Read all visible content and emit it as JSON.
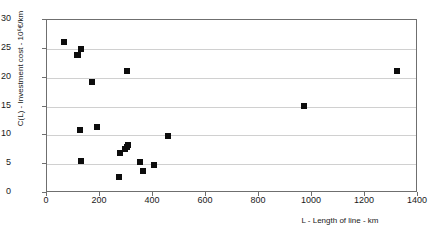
{
  "chart_data": {
    "type": "scatter",
    "title": "",
    "xlabel": "L - Length of line - km",
    "ylabel": "C(L) - Investment cost - 10⁶€/km",
    "xlim": [
      0,
      1400
    ],
    "ylim": [
      0,
      30
    ],
    "xticks": [
      0,
      200,
      400,
      600,
      800,
      1000,
      1200,
      1400
    ],
    "yticks": [
      0,
      5,
      10,
      15,
      20,
      25,
      30
    ],
    "grid": "horizontal",
    "legend": "none",
    "marker": "filled-square",
    "marker_color": "#0d0d0d",
    "series": [
      {
        "name": "Investment cost vs line length",
        "points": [
          {
            "x": 65,
            "y": 26.2
          },
          {
            "x": 113,
            "y": 24.0
          },
          {
            "x": 118,
            "y": 23.9
          },
          {
            "x": 127,
            "y": 24.9
          },
          {
            "x": 168,
            "y": 19.3
          },
          {
            "x": 300,
            "y": 21.2
          },
          {
            "x": 1320,
            "y": 21.1
          },
          {
            "x": 968,
            "y": 15.1
          },
          {
            "x": 125,
            "y": 11.0
          },
          {
            "x": 190,
            "y": 11.4
          },
          {
            "x": 457,
            "y": 9.8
          },
          {
            "x": 305,
            "y": 8.3
          },
          {
            "x": 300,
            "y": 7.9
          },
          {
            "x": 293,
            "y": 7.6
          },
          {
            "x": 277,
            "y": 7.0
          },
          {
            "x": 130,
            "y": 5.6
          },
          {
            "x": 350,
            "y": 5.4
          },
          {
            "x": 405,
            "y": 4.9
          },
          {
            "x": 363,
            "y": 3.8
          },
          {
            "x": 272,
            "y": 2.7
          }
        ]
      }
    ]
  }
}
